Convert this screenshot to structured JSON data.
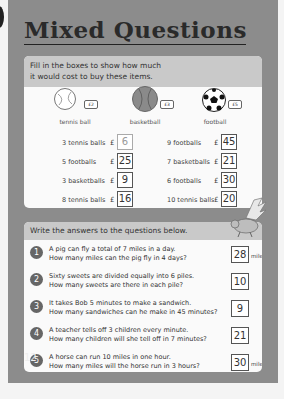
{
  "page": {
    "title": "Mixed Questions",
    "page_number": "12"
  },
  "section1": {
    "instruction_line1": "Fill in the boxes to show how much",
    "instruction_line2": "it would cost to buy these items.",
    "items": [
      {
        "name": "tennis ball",
        "price_tag": "£2",
        "icon": "tennis-ball-icon"
      },
      {
        "name": "basketball",
        "price_tag": "£3",
        "icon": "basketball-icon"
      },
      {
        "name": "football",
        "price_tag": "£5",
        "icon": "football-icon"
      }
    ],
    "currency": "£",
    "rows": [
      {
        "left_label": "3 tennis balls",
        "left_answer": "6",
        "right_label": "9 footballs",
        "right_answer": "45"
      },
      {
        "left_label": "5 footballs",
        "left_answer": "25",
        "right_label": "7 basketballs",
        "right_answer": "21"
      },
      {
        "left_label": "3 basketballs",
        "left_answer": "9",
        "right_label": "6 footballs",
        "right_answer": "30"
      },
      {
        "left_label": "8 tennis balls",
        "left_answer": "16",
        "right_label": "10 tennis balls",
        "right_answer": "20"
      }
    ]
  },
  "section2": {
    "instruction": "Write the answers to the questions below.",
    "questions": [
      {
        "num": "1",
        "line1": "A pig can fly a total of 7 miles in a day.",
        "line2": "How many miles can the pig fly in 4 days?",
        "answer": "28",
        "unit": "miles"
      },
      {
        "num": "2",
        "line1": "Sixty sweets are divided equally into 6 piles.",
        "line2": "How many sweets are there in each pile?",
        "answer": "10",
        "unit": ""
      },
      {
        "num": "3",
        "line1": "It takes Bob 5 minutes to make a sandwich.",
        "line2": "How many sandwiches can he make in 45 minutes?",
        "answer": "9",
        "unit": ""
      },
      {
        "num": "4",
        "line1": "A teacher tells off 3 children every minute.",
        "line2": "How many children will she tell off in 7 minutes?",
        "answer": "21",
        "unit": ""
      },
      {
        "num": "5",
        "line1": "A horse can run 10 miles in one hour.",
        "line2": "How many miles will the horse run in 3 hours?",
        "answer": "30",
        "unit": "miles"
      }
    ]
  }
}
